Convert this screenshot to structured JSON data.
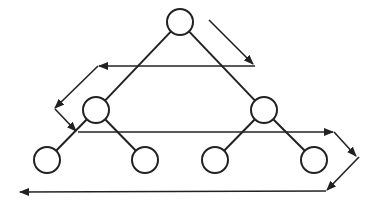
{
  "diagram": {
    "type": "binary-tree-level-order-traversal",
    "background": "#ffffff",
    "stroke_color": "#222222",
    "node_radius": 13,
    "nodes": [
      {
        "id": "root",
        "cx": 180,
        "cy": 22
      },
      {
        "id": "level1-left",
        "cx": 96,
        "cy": 110
      },
      {
        "id": "level1-right",
        "cx": 264,
        "cy": 110
      },
      {
        "id": "leaf-1",
        "cx": 47,
        "cy": 160
      },
      {
        "id": "leaf-2",
        "cx": 145,
        "cy": 160
      },
      {
        "id": "leaf-3",
        "cx": 215,
        "cy": 160
      },
      {
        "id": "leaf-4",
        "cx": 314,
        "cy": 160
      }
    ],
    "edges": [
      {
        "from": "root",
        "to": "level1-left"
      },
      {
        "from": "root",
        "to": "level1-right"
      },
      {
        "from": "level1-left",
        "to": "leaf-1"
      },
      {
        "from": "level1-left",
        "to": "leaf-2"
      },
      {
        "from": "level1-right",
        "to": "leaf-3"
      },
      {
        "from": "level1-right",
        "to": "leaf-4"
      }
    ],
    "traversal_arrows": [
      {
        "x1": 209,
        "y1": 20,
        "x2": 253,
        "y2": 64,
        "head": true
      },
      {
        "x1": 255,
        "y1": 66,
        "x2": 99,
        "y2": 66,
        "head": true
      },
      {
        "x1": 98,
        "y1": 66,
        "x2": 55,
        "y2": 108,
        "head": true
      },
      {
        "x1": 55,
        "y1": 109,
        "x2": 76,
        "y2": 131,
        "head": true
      },
      {
        "x1": 78,
        "y1": 132,
        "x2": 333,
        "y2": 132,
        "head": true
      },
      {
        "x1": 334,
        "y1": 132,
        "x2": 356,
        "y2": 156,
        "head": true
      },
      {
        "x1": 359,
        "y1": 157,
        "x2": 327,
        "y2": 190,
        "head": true
      },
      {
        "x1": 326,
        "y1": 191,
        "x2": 20,
        "y2": 192,
        "head": true
      }
    ]
  }
}
